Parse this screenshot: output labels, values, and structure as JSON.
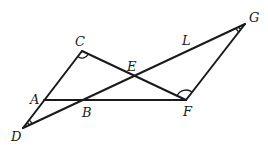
{
  "diagram": {
    "type": "geometry",
    "points": {
      "A": {
        "label": "A",
        "x": 44,
        "y": 100,
        "lx": 30,
        "ly": 104
      },
      "B": {
        "label": "B",
        "x": 82,
        "y": 100,
        "lx": 82,
        "ly": 117
      },
      "C": {
        "label": "C",
        "x": 82,
        "y": 51,
        "lx": 75,
        "ly": 46
      },
      "D": {
        "label": "D",
        "x": 23,
        "y": 128,
        "lx": 11,
        "ly": 141
      },
      "E": {
        "label": "E",
        "x": 135,
        "y": 73,
        "lx": 127,
        "ly": 71
      },
      "F": {
        "label": "F",
        "x": 186,
        "y": 100,
        "lx": 183,
        "ly": 116
      },
      "G": {
        "label": "G",
        "x": 245,
        "y": 24,
        "lx": 249,
        "ly": 22
      },
      "L": {
        "label": "L",
        "lx": 182,
        "ly": 45
      }
    },
    "segments": [
      {
        "name": "segment-DC",
        "from": "D",
        "to": "C"
      },
      {
        "name": "segment-CF",
        "from": "C",
        "to": "F"
      },
      {
        "name": "segment-DG",
        "from": "D",
        "to": "G"
      },
      {
        "name": "segment-GF",
        "from": "G",
        "to": "F"
      },
      {
        "name": "segment-AF",
        "from": "A",
        "to": "F"
      }
    ],
    "angle_marks": [
      {
        "vertex": "C",
        "arcs": 1
      },
      {
        "vertex": "F",
        "arcs": 1
      },
      {
        "vertex": "D",
        "arcs": 2
      },
      {
        "vertex": "G",
        "arcs": 2
      }
    ]
  }
}
